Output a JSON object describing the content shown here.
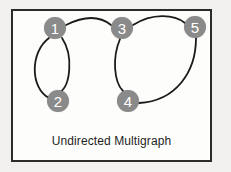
{
  "figure": {
    "caption": "Undirected Multigraph",
    "frame": {
      "x": 11,
      "y": 9,
      "width": 201,
      "height": 153,
      "border_color": "#2b2b2b",
      "fill_color": "#fdfdfc"
    },
    "background_color": "#f2f0ee",
    "node_fill_color": "#8a8a8a",
    "node_label_color": "#ffffff",
    "edge_color": "#1a1a1a"
  },
  "graph": {
    "type": "undirected multigraph",
    "node_radius": 11,
    "nodes": [
      {
        "id": "1",
        "label": "1",
        "cx": 55,
        "cy": 28
      },
      {
        "id": "2",
        "label": "2",
        "cx": 58,
        "cy": 101
      },
      {
        "id": "3",
        "label": "3",
        "cx": 122,
        "cy": 28
      },
      {
        "id": "4",
        "label": "4",
        "cx": 128,
        "cy": 101
      },
      {
        "id": "5",
        "label": "5",
        "cx": 195,
        "cy": 27
      }
    ],
    "edges": [
      {
        "id": "e1-2a",
        "source": "1",
        "target": "2",
        "path": "M 49 38 C 30 52, 30 88, 49 98"
      },
      {
        "id": "e1-2b",
        "source": "1",
        "target": "2",
        "path": "M 62 38 C 74 56, 70 86, 60 92"
      },
      {
        "id": "e1-3",
        "source": "1",
        "target": "3",
        "path": "M 66 25 C 84 16, 100 16, 111 25"
      },
      {
        "id": "e3-5",
        "source": "3",
        "target": "5",
        "path": "M 133 25 C 152 13, 174 14, 185 23"
      },
      {
        "id": "e3-4",
        "source": "3",
        "target": "4",
        "path": "M 120 39 C 112 58, 114 82, 123 91"
      },
      {
        "id": "e4-5",
        "source": "4",
        "target": "5",
        "path": "M 139 103 C 176 101, 196 72, 196 38"
      }
    ]
  }
}
